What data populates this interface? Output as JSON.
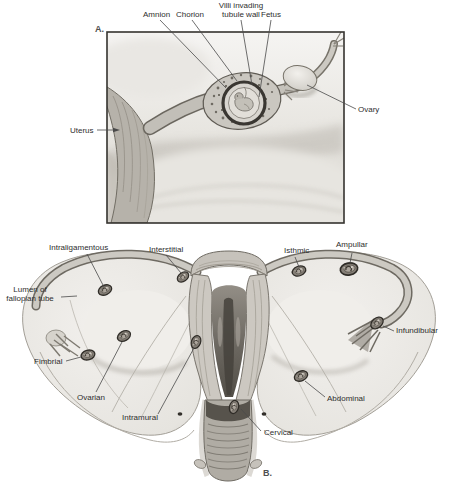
{
  "figure": {
    "panel_a": {
      "letter": "A.",
      "labels": {
        "amnion": "Amnion",
        "chorion": "Chorion",
        "villi_line1": "Villi invading",
        "villi_line2": "tubule wall",
        "fetus": "Fetus",
        "ovary": "Ovary",
        "uterus": "Uterus"
      }
    },
    "panel_b": {
      "letter": "B.",
      "labels": {
        "intraligamentous": "Intraligamentous",
        "interstitial": "Interstitial",
        "isthmic": "Isthmic",
        "ampullar": "Ampullar",
        "lumen_line1": "Lumen of",
        "lumen_line2": "fallopian tube",
        "infundibular": "Infundibular",
        "fimbrial": "Fimbrial",
        "ovarian": "Ovarian",
        "intramural": "Intramural",
        "abdominal": "Abdominal",
        "cervical": "Cervical"
      }
    },
    "colors": {
      "label_text": "#2e2e2e",
      "leader_line": "#4a4a4a",
      "panel_frame": "#35332f",
      "illustration_light": "#eceae6",
      "illustration_mid": "#c6c3bc",
      "illustration_dark": "#55524b",
      "embryo_outline": "#2f2c27"
    }
  }
}
